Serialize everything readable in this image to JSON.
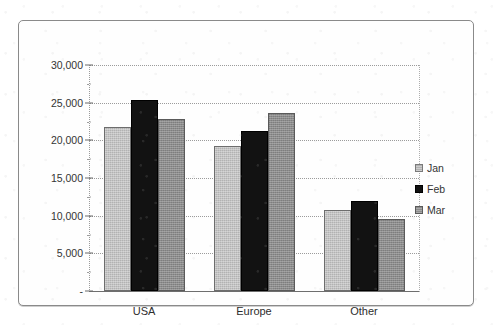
{
  "title": "",
  "chart_data": {
    "type": "bar",
    "title": "",
    "subtitle": "",
    "xlabel": "",
    "ylabel": "",
    "categories": [
      "USA",
      "Europe",
      "Other"
    ],
    "series": [
      {
        "name": "Jan",
        "color": "#b2b2b2",
        "values": [
          21800,
          19200,
          10800
        ]
      },
      {
        "name": "Feb",
        "color": "#121212",
        "values": [
          25300,
          21300,
          12000
        ]
      },
      {
        "name": "Mar",
        "color": "#8c8c8c",
        "values": [
          22800,
          23600,
          9600
        ]
      }
    ],
    "ylim": [
      0,
      30000
    ],
    "ytick_values": [
      0,
      5000,
      10000,
      15000,
      20000,
      25000,
      30000
    ],
    "ytick_labels": [
      "-",
      "5,000",
      "10,000",
      "15,000",
      "20,000",
      "25,000",
      "30,000"
    ],
    "grid": true,
    "grid_style": "dotted-horizontal",
    "legend": true,
    "legend_position": "right"
  },
  "legend": {
    "items": [
      {
        "label": "Jan",
        "swatch": "legend-swatch-jan"
      },
      {
        "label": "Feb",
        "swatch": "legend-swatch-feb"
      },
      {
        "label": "Mar",
        "swatch": "legend-swatch-mar"
      }
    ]
  }
}
